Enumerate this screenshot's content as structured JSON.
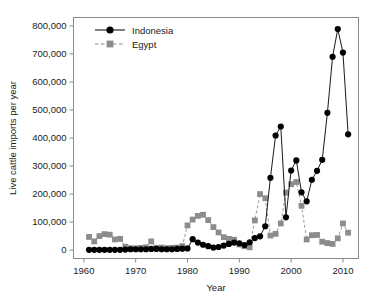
{
  "chart_data": {
    "type": "line",
    "title": "",
    "xlabel": "Year",
    "ylabel": "Live cattle imports per year",
    "xlim": [
      1958,
      2013
    ],
    "ylim": [
      -30000,
      830000
    ],
    "grid": false,
    "legend_position": "top-left",
    "xticks": [
      1960,
      1970,
      1980,
      1990,
      2000,
      2010
    ],
    "xtick_labels": [
      "1960",
      "1970",
      "1980",
      "1990",
      "2000",
      "2010"
    ],
    "yticks": [
      0,
      100000,
      200000,
      300000,
      400000,
      500000,
      600000,
      700000,
      800000
    ],
    "ytick_labels": [
      "0",
      "100,000",
      "200,000",
      "300,000",
      "400,000",
      "500,000",
      "600,000",
      "700,000",
      "800,000"
    ],
    "series": [
      {
        "name": "Indonesia",
        "color": "#000000",
        "marker": "circle",
        "linestyle": "solid",
        "x": [
          1961,
          1962,
          1963,
          1964,
          1965,
          1966,
          1967,
          1968,
          1969,
          1970,
          1971,
          1972,
          1973,
          1974,
          1975,
          1976,
          1977,
          1978,
          1979,
          1980,
          1981,
          1982,
          1983,
          1984,
          1985,
          1986,
          1987,
          1988,
          1989,
          1990,
          1991,
          1992,
          1993,
          1994,
          1995,
          1996,
          1997,
          1998,
          1999,
          2000,
          2001,
          2002,
          2003,
          2004,
          2005,
          2006,
          2007,
          2008,
          2009,
          2010,
          2011
        ],
        "values": [
          1000,
          1000,
          1000,
          1000,
          1000,
          1000,
          1000,
          2000,
          3000,
          3000,
          3000,
          3000,
          4000,
          4000,
          3000,
          3000,
          3000,
          4000,
          5000,
          6000,
          39000,
          27000,
          19000,
          14000,
          9000,
          11000,
          16000,
          22000,
          27000,
          24000,
          18000,
          28000,
          43000,
          49000,
          85000,
          258000,
          409000,
          441000,
          117000,
          284000,
          320000,
          206000,
          174000,
          251000,
          283000,
          322000,
          490000,
          690000,
          789000,
          705000,
          413000
        ]
      },
      {
        "name": "Egypt",
        "color": "#8c8c8c",
        "marker": "square",
        "linestyle": "dashed",
        "x": [
          1961,
          1962,
          1963,
          1964,
          1965,
          1966,
          1967,
          1968,
          1969,
          1970,
          1971,
          1972,
          1973,
          1974,
          1975,
          1976,
          1977,
          1978,
          1979,
          1980,
          1981,
          1982,
          1983,
          1984,
          1985,
          1986,
          1987,
          1988,
          1989,
          1990,
          1991,
          1992,
          1993,
          1994,
          1995,
          1996,
          1997,
          1998,
          1999,
          2000,
          2001,
          2002,
          2003,
          2004,
          2005,
          2006,
          2007,
          2008,
          2009,
          2010,
          2011
        ],
        "values": [
          47000,
          31000,
          50000,
          57000,
          55000,
          38000,
          40000,
          12000,
          7000,
          6000,
          8000,
          10000,
          31000,
          8000,
          9000,
          7000,
          8000,
          9000,
          14000,
          88000,
          109000,
          122000,
          126000,
          107000,
          82000,
          63000,
          46000,
          40000,
          37000,
          20000,
          14000,
          10000,
          106000,
          200000,
          185000,
          52000,
          58000,
          95000,
          205000,
          235000,
          243000,
          158000,
          38000,
          53000,
          54000,
          30000,
          25000,
          22000,
          42000,
          95000,
          62000
        ]
      }
    ]
  },
  "legend": {
    "entries": [
      {
        "label": "Indonesia"
      },
      {
        "label": "Egypt"
      }
    ]
  }
}
